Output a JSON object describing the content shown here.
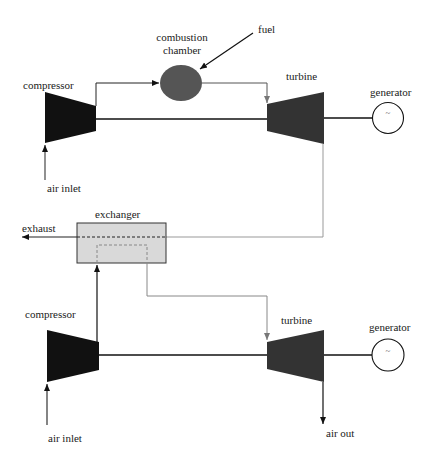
{
  "diagram": {
    "type": "process-flow",
    "top_cycle": {
      "compressor_label": "compressor",
      "air_inlet_label": "air inlet",
      "combustion_label_line1": "combustion",
      "combustion_label_line2": "chamber",
      "fuel_label": "fuel",
      "turbine_label": "turbine",
      "generator_label": "generator",
      "generator_symbol": "~"
    },
    "exchanger": {
      "label": "exchanger",
      "exhaust_label": "exhaust"
    },
    "bottom_cycle": {
      "compressor_label": "compressor",
      "air_inlet_label": "air inlet",
      "turbine_label": "turbine",
      "generator_label": "generator",
      "generator_symbol": "~",
      "air_out_label": "air out"
    },
    "colors": {
      "machine_fill": "#111111",
      "turbine_fill": "#333333",
      "chamber_fill": "#555555",
      "exchanger_fill": "#d9d9d9",
      "hot_line": "#999999",
      "line": "#111111"
    }
  }
}
